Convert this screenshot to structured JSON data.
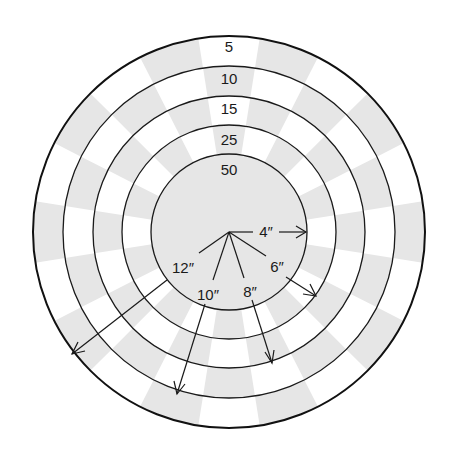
{
  "diagram": {
    "type": "target-scoring-rings",
    "center": [
      229,
      232
    ],
    "sector_count": 20,
    "colors": {
      "shade": "#e6e6e6",
      "light": "#ffffff",
      "line": "#1a1a1a"
    },
    "rings": [
      {
        "score": "5",
        "outer_radius": 196,
        "inner_radius": 166
      },
      {
        "score": "10",
        "outer_radius": 166,
        "inner_radius": 136
      },
      {
        "score": "15",
        "outer_radius": 136,
        "inner_radius": 107
      },
      {
        "score": "25",
        "outer_radius": 107,
        "inner_radius": 78
      },
      {
        "score": "50",
        "outer_radius": 78,
        "inner_radius": 0
      }
    ],
    "radius_labels": [
      {
        "label": "4″"
      },
      {
        "label": "6″"
      },
      {
        "label": "8″"
      },
      {
        "label": "10″"
      },
      {
        "label": "12″"
      }
    ]
  }
}
